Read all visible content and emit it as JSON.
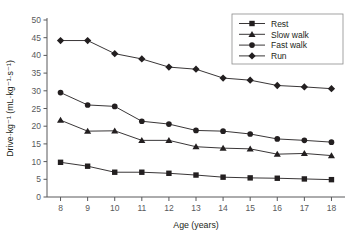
{
  "chart_data": {
    "type": "line",
    "title": "",
    "xlabel": "Age (years)",
    "ylabel": "Drive·kg⁻¹ (mL·kg⁻¹·s⁻¹)",
    "x": [
      8,
      9,
      10,
      11,
      12,
      13,
      14,
      15,
      16,
      17,
      18
    ],
    "categories": [
      "8",
      "9",
      "10",
      "11",
      "12",
      "13",
      "14",
      "15",
      "16",
      "17",
      "18"
    ],
    "xlim": [
      7.5,
      18.5
    ],
    "ylim": [
      0,
      50
    ],
    "xticks": [
      "8",
      "9",
      "10",
      "11",
      "12",
      "13",
      "14",
      "15",
      "16",
      "17",
      "18"
    ],
    "yticks": [
      "0",
      "5",
      "10",
      "15",
      "20",
      "25",
      "30",
      "35",
      "40",
      "45",
      "50"
    ],
    "grid": false,
    "legend_position": "top-right",
    "series": [
      {
        "name": "Rest",
        "marker": "square",
        "values": [
          9.8,
          8.7,
          7.0,
          7.0,
          6.7,
          6.2,
          5.6,
          5.4,
          5.3,
          5.1,
          4.9
        ]
      },
      {
        "name": "Slow walk",
        "marker": "triangle",
        "values": [
          21.7,
          18.6,
          18.7,
          16.0,
          16.0,
          14.2,
          13.8,
          13.6,
          12.1,
          12.3,
          11.7
        ]
      },
      {
        "name": "Fast walk",
        "marker": "circle",
        "values": [
          29.5,
          26.0,
          25.6,
          21.4,
          20.6,
          18.8,
          18.6,
          17.8,
          16.4,
          16.0,
          15.5
        ]
      },
      {
        "name": "Run",
        "marker": "diamond",
        "values": [
          44.2,
          44.2,
          40.5,
          39.0,
          36.7,
          36.1,
          33.6,
          33.0,
          31.5,
          31.1,
          30.6
        ]
      }
    ]
  },
  "legend": {
    "items": [
      {
        "label": "Rest"
      },
      {
        "label": "Slow walk"
      },
      {
        "label": "Fast walk"
      },
      {
        "label": "Run"
      }
    ]
  },
  "axes": {
    "x_title": "Age (years)",
    "y_title": "Drive·kg⁻¹ (mL·kg⁻¹·s⁻¹)"
  }
}
